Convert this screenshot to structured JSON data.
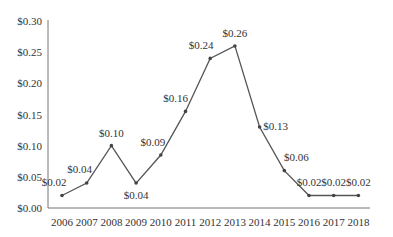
{
  "chart_data": {
    "type": "line",
    "title": "",
    "xlabel": "",
    "ylabel": "",
    "categories": [
      "2006",
      "2007",
      "2008",
      "2009",
      "2010",
      "2011",
      "2012",
      "2013",
      "2014",
      "2015",
      "2016",
      "2017",
      "2018"
    ],
    "series": [
      {
        "name": "Value",
        "values": [
          0.02,
          0.04,
          0.1,
          0.04,
          0.09,
          0.16,
          0.24,
          0.26,
          0.13,
          0.06,
          0.02,
          0.02,
          0.02
        ],
        "labels": [
          "$0.02",
          "$0.04",
          "$0.10",
          "$0.04",
          "$0.09",
          "$0.16",
          "$0.24",
          "$0.26",
          "$0.13",
          "$0.06",
          "$0.02",
          "$0.02",
          "$0.02"
        ]
      }
    ],
    "plotted_y": [
      0.02,
      0.04,
      0.1,
      0.04,
      0.085,
      0.155,
      0.24,
      0.26,
      0.13,
      0.06,
      0.02,
      0.02,
      0.02
    ],
    "ylim": [
      0,
      0.3
    ],
    "yticks": [
      0.0,
      0.05,
      0.1,
      0.15,
      0.2,
      0.25,
      0.3
    ],
    "ytick_labels": [
      "$0.00",
      "$0.05",
      "$0.10",
      "$0.15",
      "$0.20",
      "$0.25",
      "$0.30"
    ],
    "grid": false,
    "legend": "none",
    "colors": {
      "line": "#555555",
      "marker": "#444444",
      "axis": "#777777",
      "text": "#333333"
    }
  }
}
